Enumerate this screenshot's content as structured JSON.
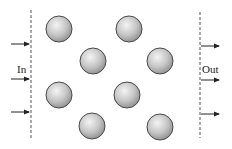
{
  "diagram": {
    "inlet_label": "In",
    "outlet_label": "Out",
    "sphere_count": 8,
    "inlet_arrow_count": 3,
    "outlet_arrow_count": 3,
    "colors": {
      "sphere_light": "#f2f2f2",
      "sphere_mid": "#c4c4c4",
      "sphere_dark": "#8a8a8a",
      "sphere_outline": "#4a4a4a",
      "boundary_line": "#555555",
      "arrow": "#222222"
    }
  }
}
